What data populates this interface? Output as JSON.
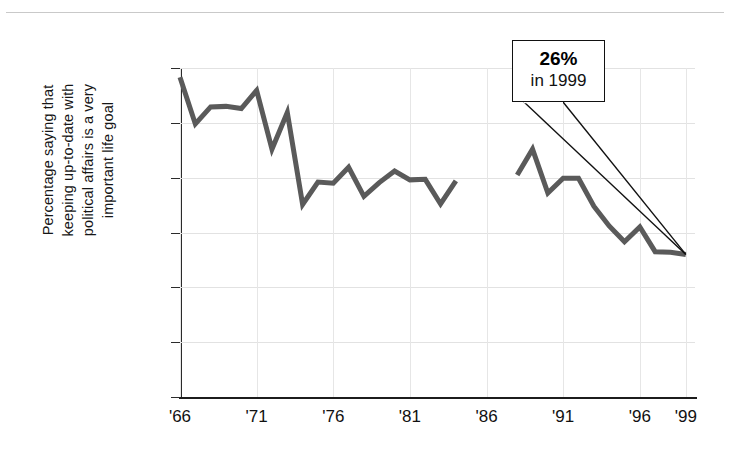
{
  "figure": {
    "y_axis_title_lines": [
      "Percentage saying that",
      "keeping up-to-date with",
      "political affairs is a very",
      "important life goal"
    ],
    "callout": {
      "value": "26%",
      "year": "in 1999"
    }
  },
  "chart_data": {
    "type": "line",
    "title": "",
    "subtitle": "",
    "xlabel": "",
    "ylabel": "Percentage saying that keeping up-to-date with political affairs is a very important life goal",
    "xlim": [
      1966,
      1999.6
    ],
    "ylim": [
      0,
      60
    ],
    "ytick_values": [
      0,
      10,
      20,
      30,
      40,
      50,
      60
    ],
    "ytick_labels": [
      "0",
      "10",
      "20",
      "30",
      "40",
      "50",
      "60"
    ],
    "xtick_values": [
      1966,
      1971,
      1976,
      1981,
      1986,
      1991,
      1996,
      1999
    ],
    "xtick_labels": [
      "'66",
      "'71",
      "'76",
      "'81",
      "'86",
      "'91",
      "'96",
      "'99"
    ],
    "grid": "both",
    "legend": "none",
    "line_color": "#5a5a5a",
    "line_width": 5,
    "annotations": [
      {
        "text_value": "26%",
        "text_year": "in 1999",
        "points_to_x": 1999,
        "points_to_y": 26
      }
    ],
    "series": [
      {
        "name": "segment-1",
        "x": [
          1966,
          1967,
          1968,
          1969,
          1970,
          1971,
          1972,
          1973,
          1974,
          1975,
          1976,
          1977,
          1978,
          1979,
          1980,
          1981,
          1982,
          1983,
          1984
        ],
        "values": [
          58.3,
          49.8,
          52.9,
          53.0,
          52.6,
          55.9,
          45.2,
          51.9,
          35.1,
          39.2,
          39.0,
          41.9,
          36.6,
          39.1,
          41.2,
          39.6,
          39.7,
          35.2,
          39.4
        ]
      },
      {
        "name": "segment-2",
        "x": [
          1988,
          1989,
          1990,
          1991,
          1992,
          1993,
          1994,
          1995,
          1996,
          1997,
          1998,
          1999
        ],
        "values": [
          40.5,
          45.2,
          37.2,
          39.9,
          39.9,
          34.8,
          31.2,
          28.3,
          31.0,
          26.5,
          26.4,
          26.0
        ]
      }
    ]
  }
}
